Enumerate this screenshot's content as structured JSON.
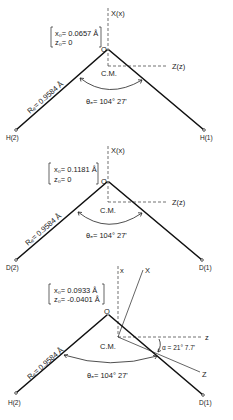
{
  "figure": {
    "panels": [
      {
        "molecule": "H2O",
        "coords": [
          "x₀= 0.0657 Å",
          "z₀= 0"
        ],
        "origin_label": "O",
        "cm_label": "C.M.",
        "axis_x_label": "X(x)",
        "axis_z_label": "Z(z)",
        "bond_label": "Rₑ= 0.9584 Å",
        "angle_label": "θₑ= 104° 27'",
        "atom_left": "H(2)",
        "atom_right": "H(1)"
      },
      {
        "molecule": "D2O",
        "coords": [
          "x₀= 0.1181 Å",
          "z₀= 0"
        ],
        "origin_label": "O",
        "cm_label": "C.M.",
        "axis_x_label": "X(x)",
        "axis_z_label": "Z(z)",
        "bond_label": "Rₑ= 0.9584 Å",
        "angle_label": "θₑ= 104° 27'",
        "atom_left": "D(2)",
        "atom_right": "D(1)"
      },
      {
        "molecule": "HDO",
        "coords": [
          "x₀= 0.0933 Å",
          "z₀= -0.0401 Å"
        ],
        "origin_label": "O",
        "cm_label": "C.M.",
        "axis_x_small": "x",
        "axis_X_principal": "X",
        "axis_z_small": "z",
        "axis_Z_principal": "Z",
        "rotation_label": "α = 21° 7.7'",
        "bond_label": "Rₑ= 0.9584 Å",
        "angle_label": "θₑ= 104° 27'",
        "atom_left": "H(2)",
        "atom_right": "D(1)"
      }
    ]
  }
}
